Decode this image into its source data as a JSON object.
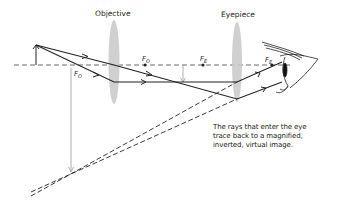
{
  "labels": {
    "objective": "Objective",
    "eyepiece": "Eyepiece",
    "focal_objective_left": "F",
    "focal_objective_left_sub": "O",
    "focal_objective_right": "F",
    "focal_objective_right_sub": "O",
    "focal_eyepiece_left": "F",
    "focal_eyepiece_left_sub": "E",
    "focal_eyepiece_right": "F",
    "focal_eyepiece_right_sub": "E"
  },
  "caption": {
    "lines": [
      "The rays that enter the eye",
      "trace back to a magnified,",
      "inverted, virtual image."
    ]
  },
  "colors": {
    "ray": "#222222",
    "lens": "#c8c8c8",
    "axis": "#444444",
    "image_arrow": "#9a9a9a"
  }
}
